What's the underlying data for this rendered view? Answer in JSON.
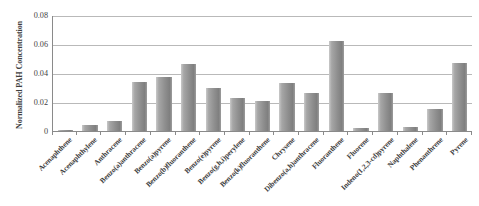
{
  "chart_data": {
    "type": "bar",
    "title": "",
    "xlabel": "",
    "ylabel": "Normalized PAH Concentration",
    "ylim": [
      0,
      0.08
    ],
    "ytick_values": [
      0,
      0.02,
      0.04,
      0.06,
      0.08
    ],
    "ytick_labels": [
      "0",
      "0.02",
      "0.04",
      "0.06",
      "0.08"
    ],
    "grid": "horizontal",
    "legend": "none",
    "bar_color": "#8f8f8f",
    "axis_color": "#8a8a8a",
    "gridline_color": "#b9b9b9",
    "categories": [
      "Acenaphthene",
      "Acenaphthylene",
      "Anthracene",
      "Benzo(a)anthracene",
      "Benzo(a)pyrene",
      "Benzo(b)fluoranthene",
      "Benzo(e)pyrene",
      "Benzo(g,h,i)perylene",
      "Benzo(k)fluoranthene",
      "Chrysene",
      "Dibenzo(a,h)anthracene",
      "Fluoranthene",
      "Fluorene",
      "Indeno(1,2,3-cd)pyrene",
      "Naphthalene",
      "Phenanthrene",
      "Pyrene"
    ],
    "values": [
      0.001,
      0.004,
      0.007,
      0.034,
      0.037,
      0.046,
      0.03,
      0.023,
      0.021,
      0.033,
      0.026,
      0.062,
      0.002,
      0.026,
      0.003,
      0.015,
      0.047
    ]
  }
}
